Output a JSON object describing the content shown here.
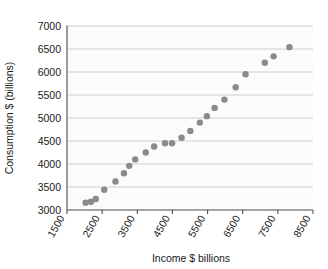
{
  "chart_data": {
    "type": "scatter",
    "title": "",
    "xlabel": "Income $ billions",
    "ylabel": "Consumption $ (billions)",
    "xlim": [
      1500,
      8500
    ],
    "ylim": [
      3000,
      7000
    ],
    "xticks": [
      1500,
      2500,
      3500,
      4500,
      5500,
      6500,
      7500,
      8500
    ],
    "yticks": [
      3000,
      3500,
      4000,
      4500,
      5000,
      5500,
      6000,
      6500,
      7000
    ],
    "xtick_labels": [
      "1500",
      "2500",
      "3500",
      "4500",
      "5500",
      "6500",
      "7500",
      "8500"
    ],
    "ytick_labels": [
      "3000",
      "3500",
      "4000",
      "4500",
      "5000",
      "5500",
      "6000",
      "6500",
      "7000"
    ],
    "xtick_rotation": -60,
    "grid": "horizontal",
    "legend": "none",
    "marker_color": "#8a8a8a",
    "marker_size": 3.2,
    "points": [
      {
        "x": 2030,
        "y": 3160
      },
      {
        "x": 2180,
        "y": 3180
      },
      {
        "x": 2320,
        "y": 3240
      },
      {
        "x": 2560,
        "y": 3440
      },
      {
        "x": 2880,
        "y": 3620
      },
      {
        "x": 3120,
        "y": 3800
      },
      {
        "x": 3270,
        "y": 3960
      },
      {
        "x": 3440,
        "y": 4100
      },
      {
        "x": 3740,
        "y": 4250
      },
      {
        "x": 3980,
        "y": 4380
      },
      {
        "x": 4290,
        "y": 4450
      },
      {
        "x": 4490,
        "y": 4450
      },
      {
        "x": 4760,
        "y": 4570
      },
      {
        "x": 5010,
        "y": 4720
      },
      {
        "x": 5280,
        "y": 4900
      },
      {
        "x": 5480,
        "y": 5040
      },
      {
        "x": 5700,
        "y": 5220
      },
      {
        "x": 5980,
        "y": 5400
      },
      {
        "x": 6300,
        "y": 5670
      },
      {
        "x": 6580,
        "y": 5950
      },
      {
        "x": 7130,
        "y": 6200
      },
      {
        "x": 7380,
        "y": 6340
      },
      {
        "x": 7830,
        "y": 6540
      }
    ]
  }
}
